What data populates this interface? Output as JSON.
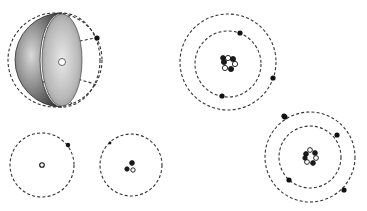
{
  "figure": {
    "type": "atomic-models-illustration",
    "colors": {
      "background": "#ffffff",
      "orbit": "#333333",
      "electron": "#111111",
      "sphere_shell": "#7a7a7a"
    },
    "models": [
      {
        "name": "sphere-cutaway",
        "cx": 55,
        "cy": 60,
        "r": 48,
        "electrons": 1
      },
      {
        "name": "atom-upper-right",
        "cx": 228,
        "cy": 62,
        "orbits": [
          34,
          48
        ],
        "electrons": 4
      },
      {
        "name": "atom-single-electron",
        "cx": 42,
        "cy": 164,
        "orbits": [
          32
        ],
        "electrons": 1
      },
      {
        "name": "atom-small-nucleus",
        "cx": 131,
        "cy": 163,
        "orbits": [
          32
        ],
        "electrons": 1
      },
      {
        "name": "atom-lower-right",
        "cx": 310,
        "cy": 157,
        "orbits": [
          31,
          46
        ],
        "electrons": 4
      }
    ]
  }
}
